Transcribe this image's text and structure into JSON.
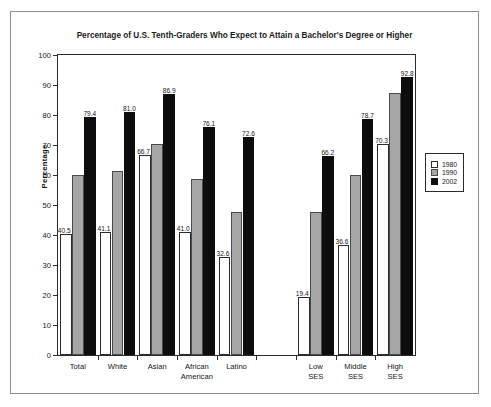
{
  "chart_data": {
    "type": "bar",
    "title": "Percentage of U.S. Tenth-Graders Who Expect to Attain a Bachelor's Degree or Higher",
    "xlabel": "",
    "ylabel": "Percentage",
    "ylim": [
      0,
      100
    ],
    "ytick_step": 10,
    "yticks": [
      "0",
      "10",
      "20",
      "30",
      "40",
      "50",
      "60",
      "70",
      "80",
      "90",
      "100"
    ],
    "grid": false,
    "legend_position": "right-outside",
    "categories": [
      "Total",
      "White",
      "Asian",
      "African American",
      "Latino",
      "Low SES",
      "Middle SES",
      "High SES"
    ],
    "category_lines": [
      [
        "Total"
      ],
      [
        "White"
      ],
      [
        "Asian"
      ],
      [
        "African",
        "American"
      ],
      [
        "Latino"
      ],
      [
        "Low",
        "SES"
      ],
      [
        "Middle",
        "SES"
      ],
      [
        "High",
        "SES"
      ]
    ],
    "series": [
      {
        "name": "1980",
        "color": "#ffffff",
        "labels_shown": true,
        "values": [
          40.5,
          41.1,
          66.7,
          41.0,
          32.6,
          19.4,
          36.6,
          70.3
        ],
        "value_labels": [
          "40.5",
          "41.1",
          "66.7",
          "41.0",
          "32.6",
          "19.4",
          "36.6",
          "70.3"
        ]
      },
      {
        "name": "1990",
        "color": "#a6a6a6",
        "labels_shown": false,
        "values": [
          60.0,
          61.3,
          70.3,
          58.8,
          47.7,
          47.7,
          60.0,
          87.3
        ],
        "value_labels": [
          "",
          "",
          "",
          "",
          "",
          "",
          "",
          ""
        ]
      },
      {
        "name": "2002",
        "color": "#0d0d0d",
        "labels_shown": true,
        "values": [
          79.4,
          81.0,
          86.9,
          76.1,
          72.6,
          66.2,
          78.7,
          92.8
        ],
        "value_labels": [
          "79.4",
          "81.0",
          "86.9",
          "76.1",
          "72.6",
          "66.2",
          "78.7",
          "92.8"
        ]
      }
    ],
    "group_gap_after_index": 4
  },
  "legend": {
    "items": [
      {
        "label": "1980",
        "swatch": "s1980"
      },
      {
        "label": "1990",
        "swatch": "s1990"
      },
      {
        "label": "2002",
        "swatch": "s2002"
      }
    ]
  }
}
